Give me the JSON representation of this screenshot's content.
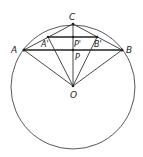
{
  "diagram": {
    "type": "geometry",
    "points": {
      "C": {
        "label": "C",
        "x": 73,
        "y": 24
      },
      "A": {
        "label": "A",
        "x": 24,
        "y": 50
      },
      "B": {
        "label": "B",
        "x": 122,
        "y": 50
      },
      "A_prime": {
        "label": "A'",
        "x": 48,
        "y": 37
      },
      "B_prime": {
        "label": "B'",
        "x": 97,
        "y": 37
      },
      "P_prime": {
        "label": "P'",
        "x": 73,
        "y": 37
      },
      "P": {
        "label": "P",
        "x": 73,
        "y": 50
      },
      "O": {
        "label": "O",
        "x": 73,
        "y": 86
      }
    },
    "circle": {
      "center": "O",
      "cx": 73,
      "cy": 87,
      "r": 62
    },
    "segments": [
      [
        "A",
        "B"
      ],
      [
        "A_prime",
        "B_prime"
      ],
      [
        "C",
        "O"
      ],
      [
        "A",
        "C"
      ],
      [
        "C",
        "B"
      ],
      [
        "A",
        "O"
      ],
      [
        "B",
        "O"
      ],
      [
        "A_prime",
        "O"
      ],
      [
        "B_prime",
        "O"
      ]
    ],
    "colors": {
      "stroke": "#333333",
      "background": "#ffffff"
    }
  }
}
